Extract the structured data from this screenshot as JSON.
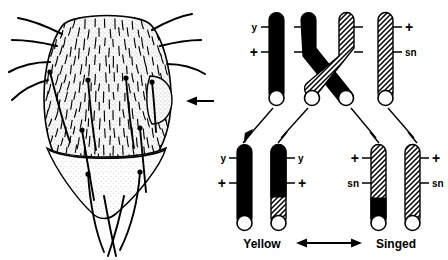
{
  "figure": {
    "type": "mitotic-recombination-twin-spot-diagram",
    "background": "#ffffff",
    "ink": "#000000"
  },
  "fly_panel": {
    "name": "drosophila-abdomen-drawing",
    "description": "Stippled line drawing of a Drosophila abdomen covered with hairs and macrochaete bristles",
    "pointer": {
      "name": "indicator-arrow",
      "direction": "left",
      "target": "bristle-patch-on-right-margin"
    }
  },
  "chromosome_panel": {
    "parent_row": {
      "chromatids": [
        {
          "id": "p1",
          "fill": "black",
          "shape": "straight",
          "labels": [
            {
              "text": "y",
              "position": "top",
              "side": "left"
            },
            {
              "text": "+",
              "position": "mid",
              "side": "left"
            }
          ]
        },
        {
          "id": "p2",
          "fill": "black",
          "shape": "crossing",
          "labels": [
            {
              "text": "",
              "position": "top",
              "side": "left"
            },
            {
              "text": "",
              "position": "mid",
              "side": "left"
            }
          ]
        },
        {
          "id": "p3",
          "fill": "stipple",
          "shape": "crossing",
          "labels": [
            {
              "text": "",
              "position": "top",
              "side": "right"
            },
            {
              "text": "",
              "position": "mid",
              "side": "right"
            }
          ]
        },
        {
          "id": "p4",
          "fill": "stipple",
          "shape": "straight",
          "labels": [
            {
              "text": "+",
              "position": "top",
              "side": "right"
            },
            {
              "text": "sn",
              "position": "mid",
              "side": "right"
            }
          ]
        }
      ],
      "crossover": {
        "name": "crossover-point",
        "between": [
          "p2",
          "p3"
        ]
      }
    },
    "segregation_arrows": {
      "name": "segregation-arrows",
      "count": 4
    },
    "daughter_row": {
      "chromatids": [
        {
          "id": "d1",
          "fill": "black",
          "black_fraction": 1.0,
          "labels": [
            {
              "text": "y",
              "position": "top",
              "side": "left"
            },
            {
              "text": "+",
              "position": "mid",
              "side": "left"
            }
          ]
        },
        {
          "id": "d2",
          "fill": "black-over-stipple",
          "black_fraction": 0.6,
          "labels": [
            {
              "text": "y",
              "position": "top",
              "side": "right"
            },
            {
              "text": "+",
              "position": "mid",
              "side": "right"
            }
          ]
        },
        {
          "id": "d3",
          "fill": "stipple-over-black",
          "black_fraction": 0.3,
          "labels": [
            {
              "text": "+",
              "position": "top",
              "side": "left"
            },
            {
              "text": "sn",
              "position": "mid",
              "side": "left"
            }
          ]
        },
        {
          "id": "d4",
          "fill": "stipple",
          "black_fraction": 0.0,
          "labels": [
            {
              "text": "+",
              "position": "top",
              "side": "right"
            },
            {
              "text": "sn",
              "position": "mid",
              "side": "right"
            }
          ]
        }
      ]
    },
    "phenotypes": {
      "left_label": "Yellow",
      "right_label": "Singed",
      "connector": {
        "name": "twin-spot-double-arrow",
        "style": "double-headed-horizontal"
      }
    }
  }
}
